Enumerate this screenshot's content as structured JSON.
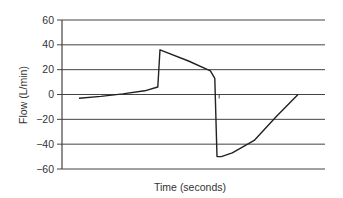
{
  "chart_data": {
    "type": "line",
    "title": "",
    "xlabel": "Time (seconds)",
    "ylabel": "Flow (L/min)",
    "ylim": [
      -60,
      60
    ],
    "yticks": [
      60,
      40,
      20,
      0,
      -20,
      -40,
      -60
    ],
    "ytick_labels": [
      "60",
      "40",
      "20",
      "0",
      "−20",
      "−40",
      "−60"
    ],
    "xticks": [],
    "grid": {
      "horizontal": true,
      "vertical": false
    },
    "legend": null,
    "series": [
      {
        "name": "Flow",
        "color": "#222222",
        "x": [
          0,
          10,
          20,
          30,
          36,
          37,
          50,
          60,
          62,
          63,
          65,
          70,
          80,
          90,
          100
        ],
        "y": [
          -3,
          -1.5,
          0.5,
          3,
          6,
          36,
          27,
          19,
          13,
          -50,
          -50,
          -47,
          -37,
          -18,
          0
        ]
      }
    ],
    "annotations": [
      {
        "type": "tick-mark",
        "x": 64,
        "y": 0,
        "note": "small vertical mark near zero line after drop"
      }
    ]
  },
  "layout": {
    "plot": {
      "left": 62,
      "right": 325,
      "top": 20,
      "bottom": 169
    },
    "x_pixel_range": [
      79,
      298
    ]
  }
}
